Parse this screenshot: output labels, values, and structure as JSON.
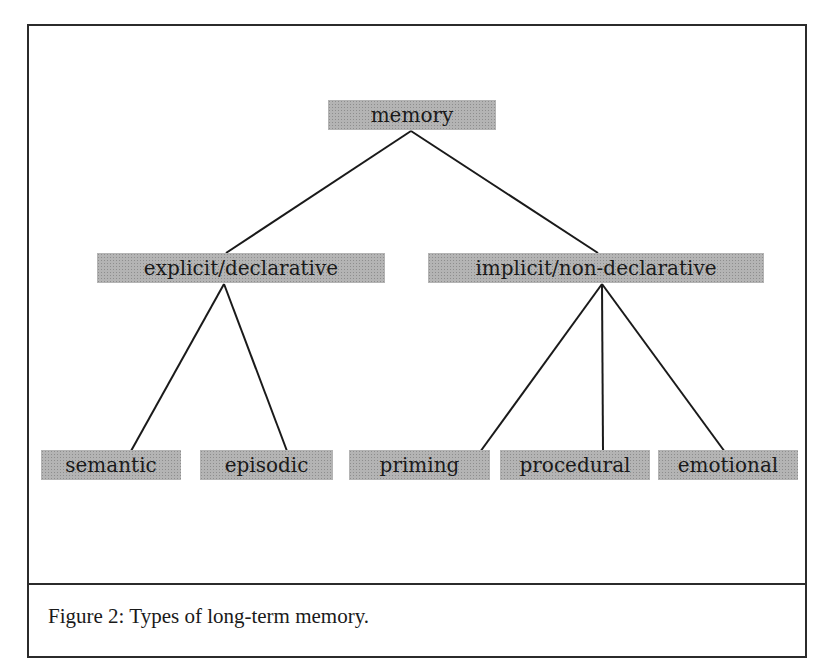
{
  "diagram": {
    "title": "Types of long-term memory",
    "root": {
      "label": "memory"
    },
    "level1": [
      {
        "label": "explicit/declarative"
      },
      {
        "label": "implicit/non-declarative"
      }
    ],
    "level2": [
      {
        "label": "semantic",
        "parent": "explicit/declarative"
      },
      {
        "label": "episodic",
        "parent": "explicit/declarative"
      },
      {
        "label": "priming",
        "parent": "implicit/non-declarative"
      },
      {
        "label": "procedural",
        "parent": "implicit/non-declarative"
      },
      {
        "label": "emotional",
        "parent": "implicit/non-declarative"
      }
    ],
    "edges": [
      [
        "memory",
        "explicit/declarative"
      ],
      [
        "memory",
        "implicit/non-declarative"
      ],
      [
        "explicit/declarative",
        "semantic"
      ],
      [
        "explicit/declarative",
        "episodic"
      ],
      [
        "implicit/non-declarative",
        "priming"
      ],
      [
        "implicit/non-declarative",
        "procedural"
      ],
      [
        "implicit/non-declarative",
        "emotional"
      ]
    ],
    "node_fill": "#b4b4b4",
    "line_color": "#1a1a1a"
  },
  "caption": {
    "text": "Figure 2: Types of long-term memory."
  }
}
